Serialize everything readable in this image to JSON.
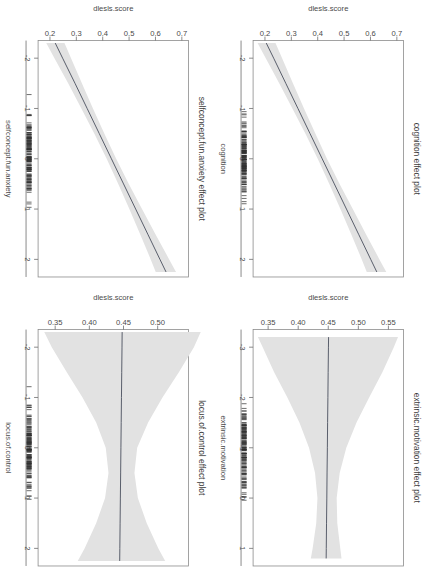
{
  "figure": {
    "type": "r-effects-multi-panel",
    "rotation_degrees": 90,
    "background": "#ffffff",
    "band_color": "#e2e2e2",
    "line_color": "#4a4f5e",
    "panel_order": [
      "cognition",
      "extrinsic_motivation",
      "selfconcept_fun_anxiety",
      "locus_of_control"
    ]
  },
  "chart_data": [
    {
      "type": "line",
      "id": "cognition",
      "title": "cognition effect plot",
      "xlabel": "cognition",
      "ylabel": "dlesls.score",
      "xlim": [
        -2.35,
        2.35
      ],
      "ylim": [
        0.155,
        0.725
      ],
      "xticks": [
        -2,
        -1,
        0,
        1,
        2
      ],
      "xticklabels": [
        "-2",
        "-1",
        "0",
        "1",
        "2"
      ],
      "yticks": [
        0.2,
        0.3,
        0.4,
        0.5,
        0.6,
        0.7
      ],
      "yticklabels": [
        "0.2",
        "0.3",
        "0.4",
        "0.5",
        "0.6",
        "0.7"
      ],
      "grid": false,
      "legend": "none",
      "x": [
        -2.3,
        -2.0,
        -1.5,
        -1.0,
        -0.5,
        0.0,
        0.5,
        1.0,
        1.5,
        2.0,
        2.25
      ],
      "fit": [
        0.205,
        0.233,
        0.279,
        0.325,
        0.371,
        0.417,
        0.463,
        0.509,
        0.555,
        0.601,
        0.624
      ],
      "ci_lower": [
        0.172,
        0.203,
        0.254,
        0.304,
        0.353,
        0.4,
        0.444,
        0.486,
        0.527,
        0.567,
        0.586
      ],
      "ci_upper": [
        0.24,
        0.265,
        0.306,
        0.348,
        0.391,
        0.435,
        0.483,
        0.533,
        0.583,
        0.634,
        0.66
      ],
      "rug": true,
      "note": "strong positive slope, narrow confidence band"
    },
    {
      "type": "line",
      "id": "extrinsic_motivation",
      "title": "extrinsic.motivation effect plot",
      "xlabel": "extrinsic.motivation",
      "ylabel": "dlesls.score",
      "xlim": [
        -3.35,
        1.35
      ],
      "ylim": [
        0.325,
        0.575
      ],
      "xticks": [
        -3,
        -2,
        -1,
        0,
        1
      ],
      "xticklabels": [
        "-3",
        "-2",
        "-1",
        "0",
        "1"
      ],
      "yticks": [
        0.35,
        0.4,
        0.45,
        0.5,
        0.55
      ],
      "yticklabels": [
        "0.35",
        "0.40",
        "0.45",
        "0.50",
        "0.55"
      ],
      "grid": false,
      "legend": "none",
      "x": [
        -3.2,
        -3.0,
        -2.5,
        -2.0,
        -1.5,
        -1.0,
        -0.5,
        0.0,
        0.5,
        1.0,
        1.2
      ],
      "fit": [
        0.4505,
        0.4503,
        0.4498,
        0.4494,
        0.4489,
        0.4485,
        0.448,
        0.4476,
        0.4471,
        0.4467,
        0.4465
      ],
      "ci_lower": [
        0.333,
        0.341,
        0.36,
        0.382,
        0.402,
        0.418,
        0.428,
        0.432,
        0.43,
        0.424,
        0.421
      ],
      "ci_upper": [
        0.566,
        0.559,
        0.54,
        0.518,
        0.497,
        0.48,
        0.469,
        0.464,
        0.465,
        0.47,
        0.472
      ],
      "rug": true,
      "note": "essentially flat fit near 0.45, confidence band widens strongly toward -3"
    },
    {
      "type": "line",
      "id": "selfconcept_fun_anxiety",
      "title": "selfconcept.fun.anxiety effect plot",
      "xlabel": "selfconcept.fun.anxiety",
      "ylabel": "dlesls.score",
      "xlim": [
        -2.35,
        2.35
      ],
      "ylim": [
        0.155,
        0.725
      ],
      "xticks": [
        -2,
        -1,
        0,
        1,
        2
      ],
      "xticklabels": [
        "-2",
        "-1",
        "0",
        "1",
        "2"
      ],
      "yticks": [
        0.2,
        0.3,
        0.4,
        0.5,
        0.6,
        0.7
      ],
      "yticklabels": [
        "0.2",
        "0.3",
        "0.4",
        "0.5",
        "0.6",
        "0.7"
      ],
      "grid": false,
      "legend": "none",
      "x": [
        -2.3,
        -2.0,
        -1.5,
        -1.0,
        -0.5,
        0.0,
        0.5,
        1.0,
        1.5,
        2.0,
        2.25
      ],
      "fit": [
        0.22,
        0.248,
        0.295,
        0.341,
        0.387,
        0.433,
        0.479,
        0.525,
        0.571,
        0.617,
        0.64
      ],
      "ci_lower": [
        0.186,
        0.217,
        0.269,
        0.319,
        0.368,
        0.415,
        0.459,
        0.501,
        0.542,
        0.582,
        0.601
      ],
      "ci_upper": [
        0.255,
        0.28,
        0.321,
        0.363,
        0.406,
        0.451,
        0.499,
        0.549,
        0.6,
        0.652,
        0.678
      ],
      "rug": true,
      "note": "strong positive slope similar to cognition panel"
    },
    {
      "type": "line",
      "id": "locus_of_control",
      "title": "locus.of.control effect plot",
      "xlabel": "locus.of.control",
      "ylabel": "dlesls.score",
      "xlim": [
        -2.35,
        2.35
      ],
      "ylim": [
        0.325,
        0.545
      ],
      "xticks": [
        -2,
        -1,
        0,
        1,
        2
      ],
      "xticklabels": [
        "-2",
        "-1",
        "0",
        "1",
        "2"
      ],
      "yticks": [
        0.35,
        0.4,
        0.45,
        0.5
      ],
      "yticklabels": [
        "0.35",
        "0.40",
        "0.45",
        "0.50"
      ],
      "grid": false,
      "legend": "none",
      "x": [
        -2.3,
        -2.0,
        -1.5,
        -1.0,
        -0.5,
        0.0,
        0.5,
        1.0,
        1.5,
        2.0,
        2.25
      ],
      "fit": [
        0.448,
        0.4478,
        0.4474,
        0.447,
        0.4466,
        0.4462,
        0.4458,
        0.4454,
        0.445,
        0.4446,
        0.4444
      ],
      "ci_lower": [
        0.334,
        0.345,
        0.367,
        0.39,
        0.41,
        0.424,
        0.428,
        0.423,
        0.41,
        0.393,
        0.383
      ],
      "ci_upper": [
        0.563,
        0.553,
        0.531,
        0.507,
        0.486,
        0.47,
        0.466,
        0.471,
        0.484,
        0.501,
        0.511
      ],
      "rug": true,
      "note": "flat fit near 0.447, hourglass confidence band widest at both extremes"
    }
  ]
}
